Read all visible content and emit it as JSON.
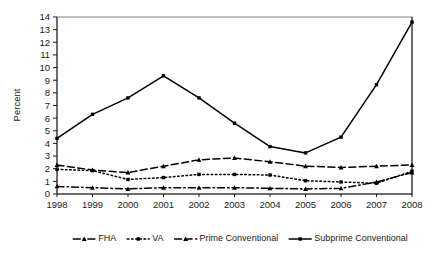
{
  "chart_data": {
    "type": "line",
    "title": "",
    "subtitle": "",
    "xlabel": "",
    "ylabel": "Percent",
    "categories": [
      "1998",
      "1999",
      "2000",
      "2001",
      "2002",
      "2003",
      "2004",
      "2005",
      "2006",
      "2007",
      "2008"
    ],
    "x": [
      1998,
      1999,
      2000,
      2001,
      2002,
      2003,
      2004,
      2005,
      2006,
      2007,
      2008
    ],
    "ylim": [
      0,
      14
    ],
    "ytick_labels": [
      "0",
      "1",
      "2",
      "3",
      "4",
      "5",
      "6",
      "7",
      "8",
      "9",
      "10",
      "11",
      "12",
      "13",
      "14"
    ],
    "ytick_values": [
      0,
      1,
      2,
      3,
      4,
      5,
      6,
      7,
      8,
      9,
      10,
      11,
      12,
      13,
      14
    ],
    "grid": false,
    "legend_position": "bottom",
    "series": [
      {
        "name": "FHA",
        "marker": "triangle",
        "dash": "dash-dot",
        "color": "#000000",
        "values": [
          0.6,
          0.5,
          0.4,
          0.5,
          0.5,
          0.5,
          0.45,
          0.4,
          0.45,
          0.95,
          1.7
        ]
      },
      {
        "name": "VA",
        "marker": "square",
        "dash": "dotted",
        "color": "#000000",
        "values": [
          1.95,
          1.85,
          1.15,
          1.3,
          1.55,
          1.55,
          1.5,
          1.05,
          0.95,
          0.85,
          1.8
        ]
      },
      {
        "name": "Prime Conventional",
        "marker": "triangle",
        "dash": "dashed",
        "color": "#000000",
        "values": [
          2.3,
          1.9,
          1.7,
          2.2,
          2.7,
          2.85,
          2.55,
          2.2,
          2.1,
          2.2,
          2.3
        ]
      },
      {
        "name": "Subprime Conventional",
        "marker": "square",
        "dash": "solid",
        "color": "#000000",
        "values": [
          4.4,
          6.3,
          7.6,
          9.35,
          7.6,
          5.6,
          3.75,
          3.25,
          4.5,
          8.65,
          13.6
        ]
      }
    ]
  },
  "axes": {
    "y_title": "Percent"
  },
  "legend": {
    "entries": [
      {
        "label": "FHA"
      },
      {
        "label": "VA"
      },
      {
        "label": "Prime Conventional"
      },
      {
        "label": "Subprime Conventional"
      }
    ]
  }
}
